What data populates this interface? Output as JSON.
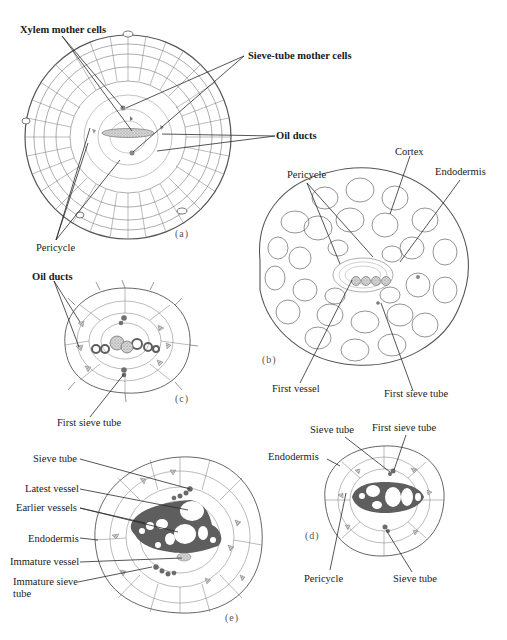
{
  "figure": {
    "panels": [
      {
        "id": "a",
        "label": "(a)",
        "annotations": [
          "Xylem mother cells",
          "Sieve-tube mother cells",
          "Oil ducts",
          "Pericycle"
        ]
      },
      {
        "id": "b",
        "label": "(b)",
        "annotations": [
          "Cortex",
          "Pericycle",
          "Endodermis",
          "First vessel",
          "First sieve tube"
        ]
      },
      {
        "id": "c",
        "label": "(c)",
        "annotations": [
          "Oil ducts",
          "First sieve tube"
        ]
      },
      {
        "id": "d",
        "label": "(d)",
        "annotations": [
          "Sieve tube",
          "First sieve tube",
          "Endodermis",
          "Pericycle",
          "Sieve tube"
        ]
      },
      {
        "id": "e",
        "label": "(e)",
        "annotations": [
          "Sieve tube",
          "Latest vessel",
          "Earlier vessels",
          "Endodermis",
          "Immature vessel",
          "Immature sieve tube"
        ]
      }
    ]
  },
  "labels": {
    "a_xylem": "Xylem mother cells",
    "a_sieve": "Sieve-tube mother cells",
    "a_oil": "Oil ducts",
    "a_pericycle": "Pericycle",
    "a_panel": "(a)",
    "b_cortex": "Cortex",
    "b_pericycle": "Pericycle",
    "b_endodermis": "Endodermis",
    "b_first_vessel": "First vessel",
    "b_first_sieve": "First sieve tube",
    "b_panel": "(b)",
    "c_oil": "Oil ducts",
    "c_first_sieve": "First sieve tube",
    "c_panel": "(c)",
    "d_sieve_top": "Sieve tube",
    "d_first_sieve": "First sieve tube",
    "d_endodermis": "Endodermis",
    "d_pericycle": "Pericycle",
    "d_sieve_bottom": "Sieve tube",
    "d_panel": "(d)",
    "e_sieve": "Sieve tube",
    "e_latest": "Latest vessel",
    "e_earlier": "Earlier vessels",
    "e_endodermis": "Endodermis",
    "e_immature_vessel": "Immature vessel",
    "e_immature_sieve_1": "Immature sieve",
    "e_immature_sieve_2": "tube",
    "e_panel": "(e)"
  },
  "colors": {
    "line": "#2a2a2a",
    "cell_stroke": "#555555",
    "stipple": "#9a9a9a",
    "vessel_wall": "#5e5e5e",
    "sieve_dark": "#6b6b6b"
  }
}
